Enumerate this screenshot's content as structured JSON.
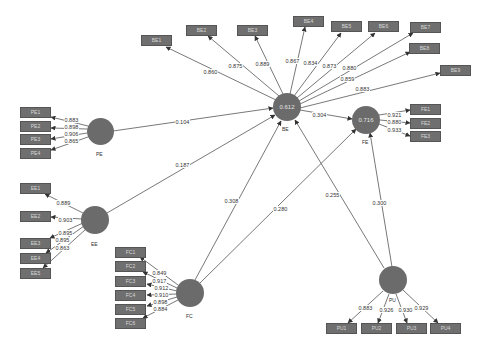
{
  "constructs": {
    "PE": {
      "label": "PE",
      "r2": ""
    },
    "BE": {
      "label": "BE",
      "r2": "0.612"
    },
    "FE": {
      "label": "FE",
      "r2": "0.716"
    },
    "EE": {
      "label": "EE",
      "r2": ""
    },
    "FC": {
      "label": "FC",
      "r2": ""
    },
    "PU": {
      "label": "PU",
      "r2": ""
    }
  },
  "indicators": {
    "PE": [
      {
        "label": "PE1",
        "loading": "0.883"
      },
      {
        "label": "PE2",
        "loading": "0.898"
      },
      {
        "label": "PE3",
        "loading": "0.906"
      },
      {
        "label": "PE4",
        "loading": "0.865"
      }
    ],
    "BE": [
      {
        "label": "BE1",
        "loading": "0.860"
      },
      {
        "label": "BE2",
        "loading": "0.875"
      },
      {
        "label": "BE3",
        "loading": "0.889"
      },
      {
        "label": "BE4",
        "loading": "0.867"
      },
      {
        "label": "BE5",
        "loading": "0.834"
      },
      {
        "label": "BE6",
        "loading": "0.873"
      },
      {
        "label": "BE7",
        "loading": "0.880"
      },
      {
        "label": "BE8",
        "loading": "0.859"
      },
      {
        "label": "BE9",
        "loading": "0.883"
      }
    ],
    "FE": [
      {
        "label": "FE1",
        "loading": "0.921"
      },
      {
        "label": "FE2",
        "loading": "0.880"
      },
      {
        "label": "FE3",
        "loading": "0.933"
      }
    ],
    "EE": [
      {
        "label": "EE1",
        "loading": "0.889"
      },
      {
        "label": "EE2",
        "loading": "0.903"
      },
      {
        "label": "EE3",
        "loading": "0.895"
      },
      {
        "label": "EE4",
        "loading": "0.895"
      },
      {
        "label": "EE5",
        "loading": "0.863"
      }
    ],
    "FC": [
      {
        "label": "FC1",
        "loading": "0.849"
      },
      {
        "label": "FC2",
        "loading": "0.917"
      },
      {
        "label": "FC3",
        "loading": "0.912"
      },
      {
        "label": "FC4",
        "loading": "0.910"
      },
      {
        "label": "FC5",
        "loading": "0.898"
      },
      {
        "label": "FC6",
        "loading": "0.884"
      }
    ],
    "PU": [
      {
        "label": "PU1",
        "loading": "0.883"
      },
      {
        "label": "PU2",
        "loading": "0.926"
      },
      {
        "label": "PU3",
        "loading": "0.930"
      },
      {
        "label": "PU4",
        "loading": "0.929"
      }
    ]
  },
  "paths": [
    {
      "from": "PE",
      "to": "BE",
      "coef": "0.104"
    },
    {
      "from": "BE",
      "to": "FE",
      "coef": "0.304"
    },
    {
      "from": "EE",
      "to": "BE",
      "coef": "0.187"
    },
    {
      "from": "FC",
      "to": "BE",
      "coef": "0.308"
    },
    {
      "from": "FC",
      "to": "FE",
      "coef": "0.280"
    },
    {
      "from": "PU",
      "to": "BE",
      "coef": "0.255"
    },
    {
      "from": "PU",
      "to": "FE",
      "coef": "0.300"
    }
  ],
  "colors": {
    "node": "#6b6b6b",
    "box": "#6f6f6f",
    "line": "#555555"
  }
}
